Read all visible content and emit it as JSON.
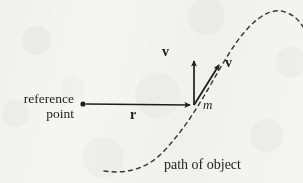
{
  "figure": {
    "background_color": "#f5f5f4",
    "ink_color": "#1d1d1d",
    "labels": {
      "reference_point_line1": "reference",
      "reference_point_line2": "point",
      "position_vector": "r",
      "velocity_vector_vertical": "v",
      "velocity_vector_tangent": "v",
      "mass": "m",
      "path_of_object": "path of object"
    },
    "geometry": {
      "reference_dot": {
        "x": 83,
        "y": 104,
        "radius": 2.6
      },
      "mass_point": {
        "x": 194,
        "y": 105
      },
      "position_arrow": {
        "x1": 86,
        "y1": 104,
        "x2": 193,
        "y2": 105
      },
      "vertical_velocity_arrow": {
        "x1": 194,
        "y1": 105,
        "x2": 194,
        "y2": 57
      },
      "tangent_velocity_arrow": {
        "x1": 194,
        "y1": 105,
        "x2": 222,
        "y2": 61
      },
      "path_curve": "M 104 171 C 124 174 146 170 163 152 C 181 133 192 116 204 96 C 218 73 232 44 250 26 C 262 14 274 8 285 12 C 294 15 299 20 303 27",
      "path_dash_pattern": "4 4.2"
    }
  }
}
